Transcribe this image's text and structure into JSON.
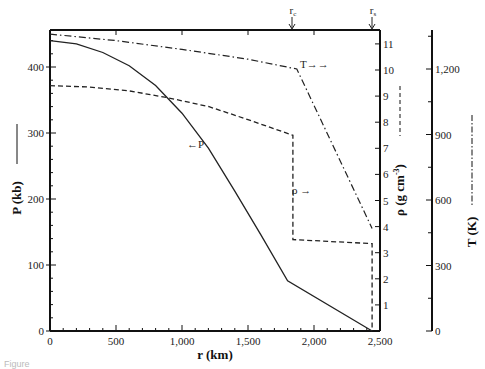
{
  "chart_data": {
    "type": "line",
    "title": "",
    "xlabel": "r (km)",
    "x_ticks": [
      "0",
      "500",
      "1,000",
      "1,500",
      "2,000",
      "2,500"
    ],
    "xlim": [
      0,
      2500
    ],
    "axes": {
      "P": {
        "label": "P (kb)",
        "ticks": [
          "0",
          "100",
          "200",
          "300",
          "400"
        ],
        "ylim": [
          0,
          450
        ],
        "position": "left",
        "line_style": "solid"
      },
      "rho": {
        "label": "ρ (g cm⁻³)",
        "ticks": [
          "1",
          "2",
          "3",
          "4",
          "5",
          "6",
          "7",
          "8",
          "9",
          "10",
          "11"
        ],
        "ylim": [
          0,
          11.3
        ],
        "position": "right-inner",
        "line_style": "dashed"
      },
      "T": {
        "label": "T (K)",
        "ticks": [
          "0",
          "300",
          "600",
          "900",
          "1,200"
        ],
        "ylim": [
          0,
          1380
        ],
        "position": "right-outer",
        "line_style": "dash-dot"
      }
    },
    "series": [
      {
        "name": "P",
        "axis": "P",
        "style": "solid",
        "x": [
          0,
          200,
          400,
          600,
          800,
          1000,
          1200,
          1400,
          1600,
          1800,
          2440
        ],
        "values": [
          440,
          435,
          422,
          402,
          372,
          330,
          277,
          212,
          145,
          76,
          0
        ]
      },
      {
        "name": "ρ",
        "axis": "rho",
        "style": "dashed",
        "x": [
          0,
          300,
          600,
          880,
          1200,
          1500,
          1840,
          1840,
          2440,
          2440
        ],
        "values": [
          9.4,
          9.35,
          9.2,
          8.95,
          8.6,
          8.1,
          7.5,
          3.5,
          3.35,
          0
        ]
      },
      {
        "name": "T",
        "axis": "T",
        "style": "dash-dot",
        "x": [
          0,
          500,
          1000,
          1500,
          1870,
          2440
        ],
        "values": [
          1360,
          1330,
          1290,
          1245,
          1200,
          470
        ]
      }
    ],
    "annotations": [
      {
        "text": "r_c",
        "x": 1840,
        "position": "top arrow"
      },
      {
        "text": "r_s",
        "x": 2440,
        "position": "top arrow"
      },
      {
        "text": "←P",
        "near": "P curve ~r=1200"
      },
      {
        "text": "ρ →",
        "near": "density jump r=1840"
      },
      {
        "text": "T→→",
        "near": "T curve kink r=1870"
      }
    ],
    "grid": false,
    "legend": "inline annotations"
  },
  "labels": {
    "xlabel": "r (km)",
    "p_axis": "P (kb)",
    "rho_axis": "ρ (g cm",
    "rho_sup": "-3",
    "rho_close": ")",
    "t_axis": "T (K)",
    "rc": "r",
    "rc_sub": "c",
    "rs": "r",
    "rs_sub": "s",
    "p_annot": "←P",
    "rho_annot": "ρ →",
    "t_annot": "T→→",
    "caption": "Figure"
  }
}
